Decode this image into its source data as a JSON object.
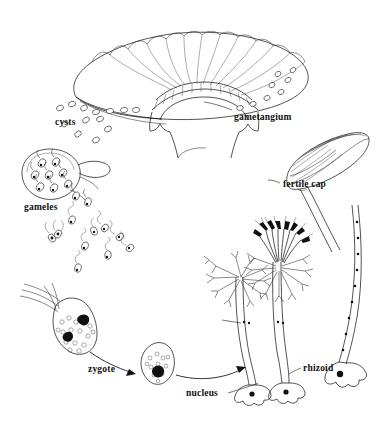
{
  "figure": {
    "background_color": "#ffffff",
    "ink_color": "#1a1a1a",
    "width": 383,
    "height": 424,
    "style": "black-and-white line drawing"
  },
  "labels": {
    "gametangium": "gametangium",
    "cysts": "cysts",
    "gameles": "gameles",
    "fertile_cap": "fertile cap",
    "zygote": "zygote",
    "nucleus": "nucleus",
    "rhizoid": "rhizoid"
  },
  "structures": [
    {
      "name": "gametangium-cap",
      "description": "large umbrella-shaped fluted cap, top center"
    },
    {
      "name": "cyst-cluster",
      "description": "scattered oval cysts released from left edge of cap"
    },
    {
      "name": "gametangium-cyst",
      "description": "large oval cell containing flagellated gametes, left"
    },
    {
      "name": "free-gametes",
      "description": "swimming biflagellate gametes, center-left"
    },
    {
      "name": "fusing-gametes",
      "description": "pair of gametes fusing into a zygote, left"
    },
    {
      "name": "zygote-cell",
      "description": "pear-shaped zygote with dark nucleus"
    },
    {
      "name": "young-thallus-left",
      "description": "upright stalk with whorl of branched hairs"
    },
    {
      "name": "young-thallus-right",
      "description": "upright stalk with whorl of hairs and developing fertile cap"
    },
    {
      "name": "mature-stalk",
      "description": "long curved stalk with nuclei, ending in rhizoid, right"
    },
    {
      "name": "fertile-cap-drawing",
      "description": "ribbed fan-shaped fertile cap on a stalk, right"
    }
  ],
  "cycle_arrows": [
    {
      "name": "zygote-arrow",
      "from": "fusing-gametes",
      "to": "zygote-cell"
    },
    {
      "name": "germination-arrow",
      "from": "zygote-cell",
      "to": "young-thallus-left"
    }
  ]
}
